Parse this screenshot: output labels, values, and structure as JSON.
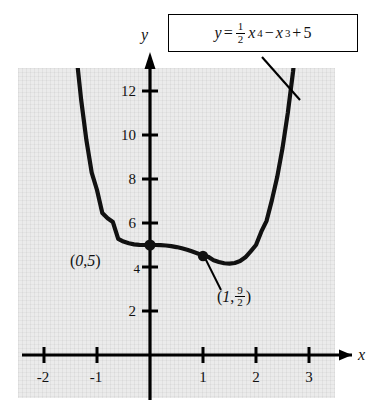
{
  "chart_data": {
    "type": "line",
    "title": "",
    "equation_label": {
      "lhs": "y",
      "equals": "=",
      "coef_num": "1",
      "coef_den": "2",
      "term1_base": "x",
      "term1_exp": "4",
      "minus": "−",
      "term2_base": "x",
      "term2_exp": "3",
      "plus": "+",
      "constant": "5",
      "plain": "y = 1/2 x^4 - x^3 + 5"
    },
    "function": "y = 0.5*x^4 - x^3 + 5",
    "xlabel": "x",
    "ylabel": "y",
    "xlim": [
      -2.5,
      3.5
    ],
    "ylim": [
      0,
      13.8
    ],
    "xticks": [
      "-2",
      "-1",
      "1",
      "2",
      "3"
    ],
    "xtick_values": [
      -2,
      -1,
      1,
      2,
      3
    ],
    "yticks": [
      "2",
      "4",
      "6",
      "8",
      "10",
      "12"
    ],
    "ytick_values": [
      2,
      4,
      6,
      8,
      10,
      12
    ],
    "grid": true,
    "legend": "none",
    "points": [
      {
        "label": "(0, 5)",
        "x": 0,
        "y": 5,
        "note": "inflection / y-intercept"
      },
      {
        "label": "(1, 9/2)",
        "x": 1,
        "y": 4.5,
        "note": "inflection point"
      }
    ],
    "annotations": [
      {
        "name": "point-label-0-5",
        "text_open": "(",
        "text_x": "0",
        "text_comma": ", ",
        "text_y": "5",
        "text_close": ")"
      },
      {
        "name": "point-label-1-9-2",
        "text_open": "(",
        "text_x": "1",
        "text_comma": ", ",
        "frac_num": "9",
        "frac_den": "2",
        "text_close": ")"
      }
    ],
    "series": [
      {
        "name": "quartic",
        "x": [
          -1.38,
          -1.3,
          -1.2,
          -1.1,
          -1.0,
          -0.9,
          -0.8,
          -0.7,
          -0.6,
          -0.5,
          -0.4,
          -0.3,
          -0.2,
          -0.1,
          0.0,
          0.1,
          0.2,
          0.3,
          0.4,
          0.5,
          0.6,
          0.7,
          0.8,
          0.9,
          1.0,
          1.1,
          1.2,
          1.3,
          1.4,
          1.5,
          1.6,
          1.7,
          1.8,
          1.9,
          2.0,
          2.1,
          2.2,
          2.3,
          2.4,
          2.5,
          2.6,
          2.7,
          2.8,
          2.9,
          2.95
        ],
        "y": [
          13.43,
          11.62,
          9.765,
          8.29,
          7.5,
          6.457,
          6.216,
          6.043,
          5.281,
          5.156,
          5.077,
          5.031,
          5.009,
          5.001,
          5.0,
          4.999,
          4.992,
          4.977,
          4.949,
          4.906,
          4.849,
          4.78,
          4.7,
          4.617,
          4.5,
          4.46,
          4.31,
          4.23,
          4.17,
          4.156,
          4.183,
          4.272,
          4.44,
          4.71,
          5.0,
          5.607,
          6.1,
          7.04,
          8.09,
          9.4,
          11.0,
          12.9,
          15.3,
          18.0,
          19.6
        ]
      }
    ],
    "curve_style": {
      "color": "#111111",
      "width": 4,
      "clipped_top": true
    }
  },
  "axes": {
    "x_axis_name": "x",
    "y_axis_name": "y",
    "x_arrow": true,
    "y_arrow": true
  }
}
